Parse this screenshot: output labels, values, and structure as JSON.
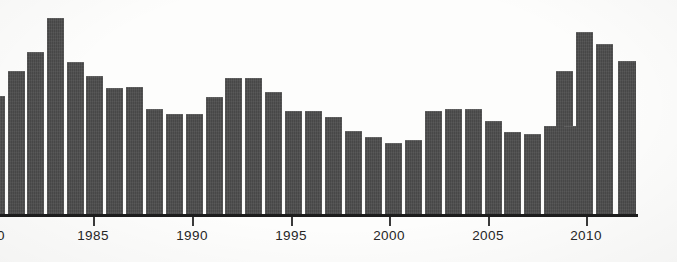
{
  "chart_data": {
    "type": "bar",
    "title": "",
    "subtitle": "",
    "xlabel": "",
    "ylabel": "",
    "grid": false,
    "legend": "none",
    "axis_color": "#1d1d1d",
    "bar_color": "#4c4c4c",
    "background_color": "#fdfdfc",
    "xlim": [
      1978.5,
      2012.5
    ],
    "ylim": [
      0,
      100
    ],
    "x_tick_labels": [
      "0",
      "1985",
      "1990",
      "1995",
      "2000",
      "2005",
      "2010"
    ],
    "x_tick_values": [
      1980,
      1985,
      1990,
      1995,
      2000,
      2005,
      2010
    ],
    "note_left_label_clipped": "0",
    "categories": [
      1979,
      1980,
      1981,
      1982,
      1983,
      1984,
      1985,
      1986,
      1987,
      1988,
      1989,
      1990,
      1991,
      1992,
      1993,
      1994,
      1995,
      1996,
      1997,
      1998,
      1999,
      2000,
      2001,
      2002,
      2003,
      2004,
      2005,
      2006,
      2007,
      2008,
      2009,
      2010,
      2011,
      2012
    ],
    "values": [
      55,
      67,
      76,
      92,
      72,
      70,
      67,
      64,
      63,
      59,
      59,
      64,
      69,
      73,
      73,
      67,
      58,
      57,
      55,
      50,
      45,
      42,
      40,
      52,
      53,
      52,
      48,
      45,
      44,
      47,
      71,
      84,
      79,
      73
    ],
    "bars": [
      {
        "year": 1979,
        "x": 0,
        "width": 5,
        "top": 96,
        "value": 55,
        "clipped": true
      },
      {
        "year": 1980,
        "x": 8,
        "width": 17,
        "top": 71,
        "value": 67,
        "clipped": false
      },
      {
        "year": 1981,
        "x": 27,
        "width": 17,
        "top": 52,
        "value": 76,
        "clipped": false
      },
      {
        "year": 1982,
        "x": 47,
        "width": 17,
        "top": 18,
        "value": 92,
        "clipped": false
      },
      {
        "year": 1983,
        "x": 67,
        "width": 17,
        "top": 62,
        "value": 72,
        "clipped": false
      },
      {
        "year": 1984,
        "x": 86,
        "width": 17,
        "top": 76,
        "value": 70,
        "clipped": false
      },
      {
        "year": 1985,
        "x": 106,
        "width": 17,
        "top": 88,
        "value": 67,
        "clipped": false
      },
      {
        "year": 1986,
        "x": 126,
        "width": 17,
        "top": 87,
        "value": 64,
        "clipped": false
      },
      {
        "year": 1987,
        "x": 146,
        "width": 17,
        "top": 109,
        "value": 63,
        "clipped": false
      },
      {
        "year": 1988,
        "x": 166,
        "width": 17,
        "top": 114,
        "value": 59,
        "clipped": false
      },
      {
        "year": 1989,
        "x": 186,
        "width": 17,
        "top": 114,
        "value": 59,
        "clipped": false
      },
      {
        "year": 1990,
        "x": 206,
        "width": 17,
        "top": 97,
        "value": 64,
        "clipped": false
      },
      {
        "year": 1991,
        "x": 225,
        "width": 17,
        "top": 78,
        "value": 69,
        "clipped": false
      },
      {
        "year": 1992,
        "x": 245,
        "width": 17,
        "top": 78,
        "value": 73,
        "clipped": false
      },
      {
        "year": 1993,
        "x": 265,
        "width": 17,
        "top": 92,
        "value": 73,
        "clipped": false
      },
      {
        "year": 1994,
        "x": 285,
        "width": 17,
        "top": 111,
        "value": 67,
        "clipped": false
      },
      {
        "year": 1995,
        "x": 305,
        "width": 17,
        "top": 111,
        "value": 58,
        "clipped": false
      },
      {
        "year": 1996,
        "x": 325,
        "width": 17,
        "top": 117,
        "value": 57,
        "clipped": false
      },
      {
        "year": 1997,
        "x": 345,
        "width": 17,
        "top": 131,
        "value": 55,
        "clipped": false
      },
      {
        "year": 1998,
        "x": 365,
        "width": 17,
        "top": 137,
        "value": 50,
        "clipped": false
      },
      {
        "year": 1999,
        "x": 385,
        "width": 17,
        "top": 143,
        "value": 45,
        "clipped": false
      },
      {
        "year": 2000,
        "x": 405,
        "width": 17,
        "top": 140,
        "value": 42,
        "clipped": false
      },
      {
        "year": 2001,
        "x": 425,
        "width": 17,
        "top": 111,
        "value": 40,
        "clipped": false
      },
      {
        "year": 2002,
        "x": 445,
        "width": 17,
        "top": 109,
        "value": 52,
        "clipped": false
      },
      {
        "year": 2003,
        "x": 465,
        "width": 17,
        "top": 109,
        "value": 53,
        "clipped": false
      },
      {
        "year": 2004,
        "x": 485,
        "width": 17,
        "top": 121,
        "value": 52,
        "clipped": false
      },
      {
        "year": 2005,
        "x": 504,
        "width": 17,
        "top": 132,
        "value": 48,
        "clipped": false
      },
      {
        "year": 2006,
        "x": 524,
        "width": 17,
        "top": 134,
        "value": 45,
        "clipped": false
      },
      {
        "year": 2007,
        "x": 544,
        "width": 17,
        "top": 126,
        "value": 44,
        "clipped": false
      },
      {
        "year": 2008,
        "x": 564,
        "width": 17,
        "top": 126,
        "value": 47,
        "clipped": false
      },
      {
        "year": 2009,
        "x": 556,
        "width": 17,
        "top": 71,
        "value": 71,
        "clipped": false
      },
      {
        "year": 2010,
        "x": 576,
        "width": 17,
        "top": 32,
        "value": 84,
        "clipped": false
      },
      {
        "year": 2011,
        "x": 596,
        "width": 17,
        "top": 44,
        "value": 79,
        "clipped": false
      },
      {
        "year": 2012,
        "x": 618,
        "width": 18,
        "top": 61,
        "value": 73,
        "clipped": false
      }
    ],
    "x_ticks": [
      {
        "label": "0",
        "x": 1,
        "clipped": true
      },
      {
        "label": "1985",
        "x": 93,
        "clipped": false
      },
      {
        "label": "1990",
        "x": 192,
        "clipped": false
      },
      {
        "label": "1995",
        "x": 291,
        "clipped": false
      },
      {
        "label": "2000",
        "x": 389,
        "clipped": false
      },
      {
        "label": "2005",
        "x": 488,
        "clipped": false
      },
      {
        "label": "2010",
        "x": 586,
        "clipped": false
      }
    ],
    "axis": {
      "x_start": 0,
      "x_end": 638
    }
  }
}
